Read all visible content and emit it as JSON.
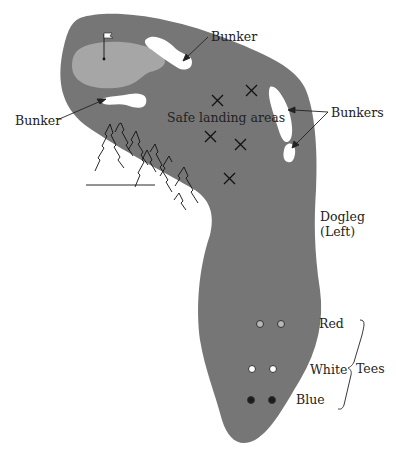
{
  "diagram": {
    "type": "golf-hole-layout",
    "colors": {
      "fairway": "#767676",
      "green": "#a6a6a6",
      "bunker": "#ffffff",
      "ink": "#222222",
      "tee_red": "#b8b8b8",
      "tee_white": "#ffffff",
      "tee_blue": "#1a1a1a"
    },
    "labels": {
      "bunker_top": "Bunker",
      "bunker_left": "Bunker",
      "bunkers_right": "Bunkers",
      "safe_landing": "Safe landing areas",
      "dogleg_line1": "Dogleg",
      "dogleg_line2": "(Left)",
      "tee_red": "Red",
      "tee_white": "White",
      "tee_blue": "Blue",
      "tees": "Tees"
    },
    "landing_marks": 5,
    "tees": [
      {
        "name": "Red",
        "count": 2
      },
      {
        "name": "White",
        "count": 2
      },
      {
        "name": "Blue",
        "count": 2
      }
    ]
  }
}
